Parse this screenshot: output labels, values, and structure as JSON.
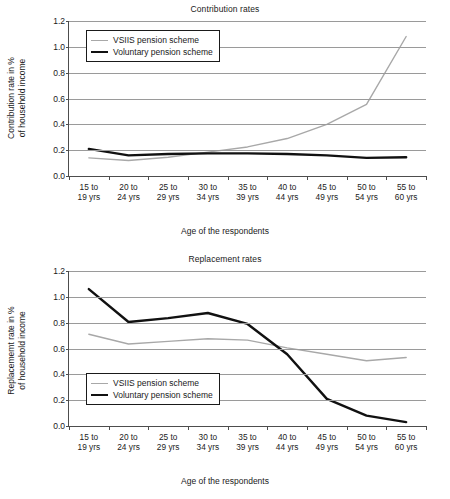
{
  "figure": {
    "caption": ""
  },
  "colors": {
    "vsiis": "#a8a8a8",
    "voluntary": "#111111",
    "grid": "#9a9a9a",
    "axis": "#4d4d4d",
    "text": "#1a1a1a",
    "background": "#ffffff"
  },
  "legend": {
    "vsiis_label": "VSIIS pension scheme",
    "voluntary_label": "Voluntary pension scheme"
  },
  "chart_data": [
    {
      "id": "contribution-rates",
      "type": "line",
      "title": "Contribution rates",
      "xlabel": "Age of the respondents",
      "ylabel_line1": "Contribution rate in %",
      "ylabel_line2": "of household income",
      "categories": [
        "15 to 19 yrs",
        "20 to 24 yrs",
        "25 to 29 yrs",
        "30 to 34 yrs",
        "35 to 39 yrs",
        "40 to 44 yrs",
        "45 to 49 yrs",
        "50 to 54 yrs",
        "55 to 60 yrs"
      ],
      "categories_top": [
        "15 to",
        "20 to",
        "25 to",
        "30 to",
        "35 to",
        "40 to",
        "45 to",
        "50 to",
        "55 to"
      ],
      "categories_bottom": [
        "19 yrs",
        "24 yrs",
        "29 yrs",
        "34 yrs",
        "39 yrs",
        "44 yrs",
        "49 yrs",
        "54 yrs",
        "60 yrs"
      ],
      "ylim": [
        0.0,
        1.2
      ],
      "yticks": [
        0.0,
        0.2,
        0.4,
        0.6,
        0.8,
        1.0,
        1.2
      ],
      "ytick_labels": [
        "0.0",
        "0.2",
        "0.4",
        "0.6",
        "0.8",
        "1.0",
        "1.2"
      ],
      "grid": true,
      "legend_position": "top-left",
      "series": [
        {
          "name": "VSIIS pension scheme",
          "color": "#a8a8a8",
          "width": 1.4,
          "values": [
            0.14,
            0.12,
            0.145,
            0.185,
            0.225,
            0.29,
            0.4,
            0.555,
            1.08
          ]
        },
        {
          "name": "Voluntary pension scheme",
          "color": "#111111",
          "width": 2.4,
          "values": [
            0.21,
            0.16,
            0.17,
            0.175,
            0.175,
            0.17,
            0.16,
            0.14,
            0.145
          ]
        }
      ]
    },
    {
      "id": "replacement-rates",
      "type": "line",
      "title": "Replacement rates",
      "xlabel": "Age of the respondents",
      "ylabel_line1": "Replacememt rate in %",
      "ylabel_line2": "of household income",
      "categories": [
        "15 to 19 yrs",
        "20 to 24 yrs",
        "25 to 29 yrs",
        "30 to 34 yrs",
        "35 to 39 yrs",
        "40 to 44 yrs",
        "45 to 49 yrs",
        "50 to 54 yrs",
        "55 to 60 yrs"
      ],
      "categories_top": [
        "15 to",
        "20 to",
        "25 to",
        "30 to",
        "35 to",
        "40 to",
        "45 to",
        "50 to",
        "55 to"
      ],
      "categories_bottom": [
        "19 yrs",
        "24 yrs",
        "29 yrs",
        "34 yrs",
        "39 yrs",
        "44 yrs",
        "49 yrs",
        "54 yrs",
        "60 yrs"
      ],
      "ylim": [
        0.0,
        1.2
      ],
      "yticks": [
        0.0,
        0.2,
        0.4,
        0.6,
        0.8,
        1.0,
        1.2
      ],
      "ytick_labels": [
        "0.0",
        "0.2",
        "0.4",
        "0.6",
        "0.8",
        "1.0",
        "1.2"
      ],
      "grid": true,
      "legend_position": "bottom-left",
      "series": [
        {
          "name": "VSIIS pension scheme",
          "color": "#a8a8a8",
          "width": 1.4,
          "values": [
            0.71,
            0.635,
            0.655,
            0.675,
            0.665,
            0.605,
            0.555,
            0.505,
            0.53
          ]
        },
        {
          "name": "Voluntary pension scheme",
          "color": "#111111",
          "width": 2.4,
          "values": [
            1.06,
            0.805,
            0.835,
            0.875,
            0.79,
            0.555,
            0.21,
            0.08,
            0.03
          ]
        }
      ]
    }
  ]
}
